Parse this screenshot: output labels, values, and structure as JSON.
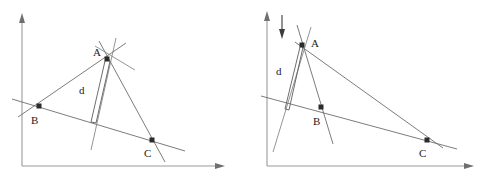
{
  "figure": {
    "background_color": "#ffffff",
    "line_color": "#6d6d6d",
    "axis_color": "#9a9a9a",
    "point_color": "#2b2b2b",
    "label_color": "#1c1c1c",
    "panel_count": 2
  },
  "panels": [
    {
      "id": "left-panel",
      "name": "triangle-diagram-large-distance",
      "axes": {
        "y_axis": {
          "name": "y-axis",
          "x": 22,
          "y_top": 14,
          "y_bottom": 166,
          "arrow": "up"
        },
        "x_axis": {
          "name": "x-axis",
          "y": 166,
          "x_left": 22,
          "x_right": 224,
          "arrow": "right"
        }
      },
      "points": [
        {
          "label": "A",
          "x": 107,
          "y": 59,
          "label_x": 96,
          "label_y": 56
        },
        {
          "label": "B",
          "x": 39,
          "y": 106,
          "label_x": 33,
          "label_y": 124
        },
        {
          "label": "C",
          "x": 152,
          "y": 140,
          "label_x": 145,
          "label_y": 158
        }
      ],
      "distance_marker": {
        "label": "d",
        "label_x": 79,
        "label_y": 94,
        "width": "wide"
      },
      "direction_arrow": null
    },
    {
      "id": "right-panel",
      "name": "triangle-diagram-small-distance",
      "axes": {
        "y_axis": {
          "name": "y-axis",
          "x": 22,
          "y_top": 12,
          "y_bottom": 166,
          "arrow": "up"
        },
        "x_axis": {
          "name": "x-axis",
          "y": 166,
          "x_left": 22,
          "x_right": 228,
          "arrow": "right"
        }
      },
      "points": [
        {
          "label": "A",
          "x": 57,
          "y": 45,
          "label_x": 67,
          "label_y": 45
        },
        {
          "label": "B",
          "x": 76,
          "y": 107,
          "label_x": 69,
          "label_y": 125
        },
        {
          "label": "C",
          "x": 182,
          "y": 140,
          "label_x": 175,
          "label_y": 158
        }
      ],
      "distance_marker": {
        "label": "d",
        "label_x": 33,
        "label_y": 73,
        "width": "narrow"
      },
      "direction_arrow": {
        "name": "downward-arrow",
        "x": 37,
        "y_top": 15,
        "y_bottom": 38,
        "direction": "down"
      }
    }
  ],
  "labels": {
    "point_a": "A",
    "point_b": "B",
    "point_c": "C",
    "distance": "d"
  }
}
